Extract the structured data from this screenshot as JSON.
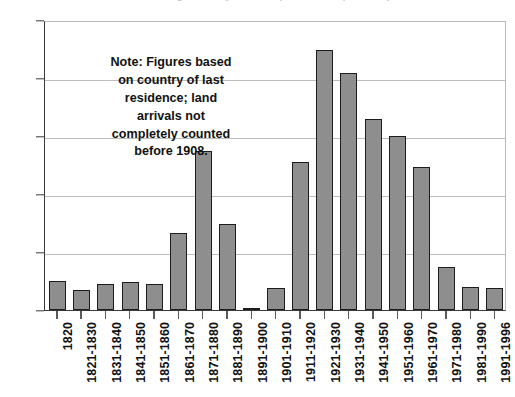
{
  "figure": {
    "clipped_title": "U.S. Immigration by Decade (millions of persons)"
  },
  "note": {
    "lines": [
      "Note: Figures based",
      "on country of last",
      "residence; land",
      "arrivals not",
      "completely counted",
      "before 1908."
    ]
  },
  "colors": {
    "bar_fill": "#8e8e8e",
    "bar_edge": "#1c1c1c",
    "gridline": "#bdbdbd",
    "axis": "#3a3a3a",
    "text": "#111111",
    "background": "#ffffff"
  },
  "chart_data": {
    "type": "bar",
    "title": "",
    "xlabel": "",
    "ylabel": "",
    "ylim": [
      0.0,
      25.0
    ],
    "yticks": [
      "0.0",
      "5.0",
      "10.0",
      "15.0",
      "20.0",
      "25.0"
    ],
    "ytick_values": [
      0.0,
      5.0,
      10.0,
      15.0,
      20.0,
      25.0
    ],
    "grid": true,
    "legend": false,
    "categories": [
      "1820",
      "1821-1830",
      "1831-1840",
      "1841-1850",
      "1851-1860",
      "1861-1870",
      "1871-1880",
      "1881-1890",
      "1891-1900",
      "1901-1910",
      "1911-1920",
      "1921-1930",
      "1931-1940",
      "1941-1950",
      "1951-1960",
      "1961-1970",
      "1971-1980",
      "1981-1990",
      "1991-1996"
    ],
    "values": [
      2.5,
      1.7,
      2.2,
      2.4,
      2.2,
      6.6,
      13.7,
      7.4,
      0.1,
      1.9,
      12.8,
      22.4,
      20.4,
      16.5,
      15.0,
      12.3,
      3.7,
      2.0,
      1.9
    ]
  }
}
